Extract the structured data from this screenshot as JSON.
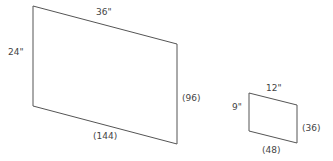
{
  "colors": {
    "stroke": "#555555",
    "text": "#444444",
    "background": "#ffffff"
  },
  "large_rectangle": {
    "top_label": "36\"",
    "left_label": "24\"",
    "right_label": "(96)",
    "bottom_label": "(144)"
  },
  "small_rectangle": {
    "top_label": "12\"",
    "left_label": "9\"",
    "right_label": "(36)",
    "bottom_label": "(48)"
  }
}
